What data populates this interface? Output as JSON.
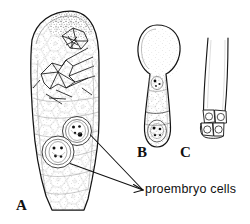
{
  "figure": {
    "background_color": "#ffffff",
    "ink_color": "#111111",
    "panels": [
      {
        "id": "A",
        "label": "A",
        "description": "ovule / nucellus longitudinal section with crystal druses and two proembryo cells"
      },
      {
        "id": "B",
        "label": "B",
        "description": "club-shaped embryo sac with basal proembryo cells"
      },
      {
        "id": "C",
        "label": "C",
        "description": "elongate tube with four-celled proembryo at base"
      }
    ],
    "annotations": [
      {
        "id": "proembryo-cells",
        "text": "proembryo cells",
        "leader_targets": 2
      }
    ],
    "panel_c_cell_count": 4,
    "panel_a_proembryo_count": 2
  }
}
